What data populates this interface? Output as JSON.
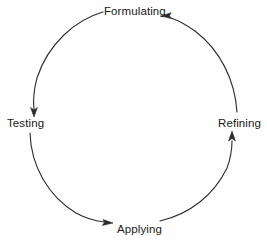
{
  "diagram": {
    "type": "cycle",
    "title": "",
    "background_color": "#fefefe",
    "stroke_color": "#2b2b2b",
    "text_color": "#1a1a1a",
    "direction": "clockwise-from-formulating-to-testing",
    "nodes": [
      {
        "id": "formulating",
        "label": "Formulating",
        "position": "top",
        "x": 133,
        "y": 11
      },
      {
        "id": "refining",
        "label": "Refining",
        "position": "right",
        "x": 240,
        "y": 123
      },
      {
        "id": "applying",
        "label": "Applying",
        "position": "bottom",
        "x": 139,
        "y": 229
      },
      {
        "id": "testing",
        "label": "Testing",
        "position": "left",
        "x": 26,
        "y": 123
      }
    ],
    "arcs": [
      {
        "id": "formulating-to-testing",
        "from": "formulating",
        "to": "testing",
        "arrowhead_at": "testing",
        "arrow_direction": "down"
      },
      {
        "id": "testing-to-applying",
        "from": "testing",
        "to": "applying",
        "arrowhead_at": "applying",
        "arrow_direction": "right"
      },
      {
        "id": "applying-to-refining",
        "from": "applying",
        "to": "refining",
        "arrowhead_at": "refining",
        "arrow_direction": "up"
      },
      {
        "id": "refining-to-formulating",
        "from": "refining",
        "to": "formulating",
        "arrowhead_at": "formulating",
        "arrow_direction": "left"
      }
    ],
    "circle": {
      "center_x": 133,
      "center_y": 120,
      "radius": 106
    },
    "footer_text": ""
  }
}
